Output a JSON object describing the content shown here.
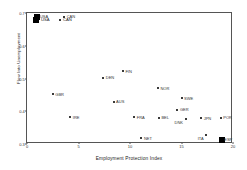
{
  "chart_data": {
    "type": "scatter",
    "title": "",
    "xlabel": "Employment Protection Index",
    "ylabel": "Flow Into Unemployment",
    "xlim": [
      0,
      20
    ],
    "ylim": [
      0.3,
      0.7
    ],
    "xticks": [
      "0",
      "5",
      "10",
      "15",
      "20"
    ],
    "xtick_values": [
      0,
      5,
      10,
      15,
      20
    ],
    "yticks": [
      "0.7",
      "0.6",
      "0.5",
      "0.4",
      "0.3"
    ],
    "ytick_values": [
      0.7,
      0.6,
      0.5,
      0.4,
      0.3
    ],
    "grid": false,
    "legend_position": "top-left-inside",
    "legend": [
      {
        "label": "USA",
        "marker": "filled-square"
      },
      {
        "label": "CAN",
        "marker": "small-dot"
      }
    ],
    "points": [
      {
        "label": "USA",
        "x": 1.0,
        "y": 0.688,
        "marker": "filled-square",
        "label_pos": "right"
      },
      {
        "label": "CAN",
        "x": 3.6,
        "y": 0.688,
        "marker": "small-dot",
        "label_pos": "right"
      },
      {
        "label": "GBR",
        "x": 2.5,
        "y": 0.452,
        "marker": "small-dot",
        "label_pos": "right"
      },
      {
        "label": "IRE",
        "x": 4.2,
        "y": 0.382,
        "marker": "small-dot",
        "label_pos": "right"
      },
      {
        "label": "DEN",
        "x": 7.4,
        "y": 0.502,
        "marker": "small-dot",
        "label_pos": "right"
      },
      {
        "label": "FIN",
        "x": 9.3,
        "y": 0.522,
        "marker": "small-dot",
        "label_pos": "right"
      },
      {
        "label": "AUS",
        "x": 8.4,
        "y": 0.428,
        "marker": "small-dot",
        "label_pos": "right"
      },
      {
        "label": "FRA",
        "x": 10.4,
        "y": 0.382,
        "marker": "small-dot",
        "label_pos": "right"
      },
      {
        "label": "NET",
        "x": 11.1,
        "y": 0.318,
        "marker": "small-dot",
        "label_pos": "right"
      },
      {
        "label": "NOR",
        "x": 12.7,
        "y": 0.47,
        "marker": "small-dot",
        "label_pos": "right"
      },
      {
        "label": "BEL",
        "x": 12.8,
        "y": 0.38,
        "marker": "small-dot",
        "label_pos": "right"
      },
      {
        "label": "SWE",
        "x": 15.0,
        "y": 0.44,
        "marker": "small-dot",
        "label_pos": "right"
      },
      {
        "label": "GER",
        "x": 14.6,
        "y": 0.404,
        "marker": "small-dot",
        "label_pos": "right"
      },
      {
        "label": "DNK",
        "x": 15.4,
        "y": 0.376,
        "marker": "small-dot",
        "label_pos": "left"
      },
      {
        "label": "JPN",
        "x": 16.9,
        "y": 0.378,
        "marker": "small-dot",
        "label_pos": "right"
      },
      {
        "label": "ITA",
        "x": 17.4,
        "y": 0.326,
        "marker": "small-dot",
        "label_pos": "left"
      },
      {
        "label": "POR",
        "x": 18.8,
        "y": 0.38,
        "marker": "small-dot",
        "label_pos": "right"
      },
      {
        "label": "ESP",
        "x": 18.9,
        "y": 0.312,
        "marker": "filled-square",
        "label_pos": "right"
      }
    ]
  }
}
